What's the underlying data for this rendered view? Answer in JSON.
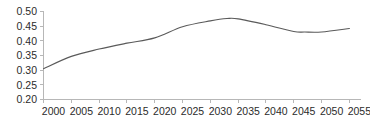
{
  "chart_data": {
    "type": "line",
    "title": "",
    "subtitle": "",
    "xlabel": "",
    "ylabel": "",
    "xlim": [
      2000,
      2057
    ],
    "ylim": [
      0.2,
      0.5
    ],
    "grid": false,
    "legend": null,
    "legend_position": "none",
    "line_color": "#5a5a5a",
    "axis_color": "#b7b7b7",
    "label_color": "#2b2b2b",
    "x_tick_labels": [
      "2000",
      "2005",
      "2010",
      "2015",
      "2020",
      "2025",
      "2030",
      "2035",
      "2040",
      "2045",
      "2050",
      "2055"
    ],
    "x_ticks": [
      2000,
      2005,
      2010,
      2015,
      2020,
      2025,
      2030,
      2035,
      2040,
      2045,
      2050,
      2055
    ],
    "y_tick_labels": [
      "0.50",
      "0.45",
      "0.40",
      "0.35",
      "0.30",
      "0.25",
      "0.20"
    ],
    "y_ticks": [
      0.5,
      0.45,
      0.4,
      0.35,
      0.3,
      0.25,
      0.2
    ],
    "series": [
      {
        "name": "series-1",
        "x": [
          2000,
          2005,
          2010,
          2015,
          2020,
          2025,
          2030,
          2033,
          2035,
          2040,
          2045,
          2047,
          2050,
          2055
        ],
        "values": [
          0.305,
          0.347,
          0.372,
          0.392,
          0.41,
          0.448,
          0.468,
          0.476,
          0.475,
          0.455,
          0.432,
          0.43,
          0.43,
          0.442
        ]
      }
    ]
  }
}
